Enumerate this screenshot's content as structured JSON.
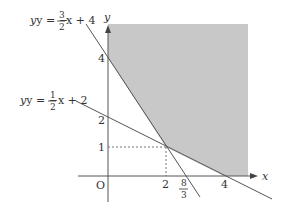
{
  "diagram": {
    "type": "linear-inequality-region",
    "axes": {
      "x_label": "x",
      "y_label": "y",
      "origin_label": "O"
    },
    "lines": [
      {
        "id": "line1",
        "equation_prefix": "y = −",
        "frac_num": "3",
        "frac_den": "2",
        "equation_suffix": "x + 4",
        "slope": -1.5,
        "intercept": 4
      },
      {
        "id": "line2",
        "equation_prefix": "y = −",
        "frac_num": "1",
        "frac_den": "2",
        "equation_suffix": "x + 2",
        "slope": -0.5,
        "intercept": 2
      }
    ],
    "y_ticks": [
      "4",
      "2",
      "1"
    ],
    "x_ticks": [
      "2",
      "4"
    ],
    "x_tick_frac": {
      "num": "8",
      "den": "3"
    },
    "intersection_point": {
      "x": 2,
      "y": 1
    },
    "colors": {
      "shade": "#c8c8c8",
      "line": "#555555",
      "dashed": "#777777"
    }
  }
}
